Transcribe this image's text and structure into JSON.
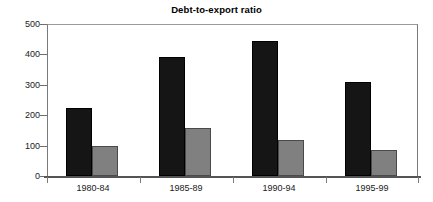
{
  "chart_data": {
    "type": "bar",
    "title": "Debt-to-export ratio",
    "xlabel": "",
    "ylabel": "",
    "categories": [
      "1980-84",
      "1985-89",
      "1990-94",
      "1995-99"
    ],
    "series": [
      {
        "name": "series-1",
        "color": "#151515",
        "values": [
          224,
          390,
          445,
          310
        ]
      },
      {
        "name": "series-2",
        "color": "#808080",
        "values": [
          100,
          158,
          118,
          85
        ]
      }
    ],
    "ylim": [
      0,
      500
    ],
    "yticks": [
      0,
      100,
      200,
      300,
      400,
      500
    ],
    "ytick_labels": [
      "0",
      "100",
      "200",
      "300",
      "400",
      "500"
    ],
    "grid": false,
    "legend": "none"
  },
  "axis": {
    "y_labels": [
      "500",
      "400",
      "300",
      "200",
      "100",
      "0"
    ]
  }
}
